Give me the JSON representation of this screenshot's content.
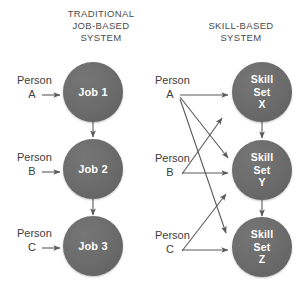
{
  "diagram": {
    "panels": [
      {
        "id": "traditional",
        "title_lines": [
          "TRADITIONAL",
          "JOB-BASED",
          "SYSTEM"
        ],
        "title_text": "TRADITIONAL JOB-BASED SYSTEM",
        "persons": [
          {
            "name": "Person",
            "letter": "A"
          },
          {
            "name": "Person",
            "letter": "B"
          },
          {
            "name": "Person",
            "letter": "C"
          }
        ],
        "nodes": [
          {
            "id": "job1",
            "lines": [
              "Job 1"
            ],
            "label": "Job 1"
          },
          {
            "id": "job2",
            "lines": [
              "Job 2"
            ],
            "label": "Job 2"
          },
          {
            "id": "job3",
            "lines": [
              "Job 3"
            ],
            "label": "Job 3"
          }
        ]
      },
      {
        "id": "skill",
        "title_lines": [
          "SKILL-BASED",
          "SYSTEM"
        ],
        "title_text": "SKILL-BASED SYSTEM",
        "persons": [
          {
            "name": "Person",
            "letter": "A"
          },
          {
            "name": "Person",
            "letter": "B"
          },
          {
            "name": "Person",
            "letter": "C"
          }
        ],
        "nodes": [
          {
            "id": "skillx",
            "lines": [
              "Skill",
              "Set",
              "X"
            ],
            "label": "Skill Set X"
          },
          {
            "id": "skilly",
            "lines": [
              "Skill",
              "Set",
              "Y"
            ],
            "label": "Skill Set Y"
          },
          {
            "id": "skillz",
            "lines": [
              "Skill",
              "Set",
              "Z"
            ],
            "label": "Skill Set Z"
          }
        ]
      }
    ],
    "colors": {
      "node_fill": "#6b6b6b",
      "node_text": "#ffffff",
      "line": "#5a5a5a",
      "label_text": "#3d3d3d",
      "background": "#ffffff"
    },
    "connections": {
      "traditional": [
        {
          "from": "Person A",
          "to": "Job 1"
        },
        {
          "from": "Person B",
          "to": "Job 2"
        },
        {
          "from": "Person C",
          "to": "Job 3"
        },
        {
          "from": "Job 1",
          "to": "Job 2"
        },
        {
          "from": "Job 2",
          "to": "Job 3"
        }
      ],
      "skill": [
        {
          "from": "Person A",
          "to": "Skill Set X"
        },
        {
          "from": "Person A",
          "to": "Skill Set Y"
        },
        {
          "from": "Person A",
          "to": "Skill Set Z"
        },
        {
          "from": "Person B",
          "to": "Skill Set X"
        },
        {
          "from": "Person B",
          "to": "Skill Set Y"
        },
        {
          "from": "Person C",
          "to": "Skill Set Y"
        },
        {
          "from": "Person C",
          "to": "Skill Set Z"
        },
        {
          "from": "Skill Set X",
          "to": "Skill Set Y"
        },
        {
          "from": "Skill Set Y",
          "to": "Skill Set Z"
        }
      ]
    }
  }
}
